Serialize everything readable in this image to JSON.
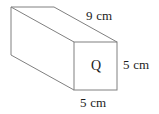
{
  "figure": {
    "name": "rectangular-prism-diagram",
    "shape": "rectangular prism",
    "line_color": "#808080",
    "text_color": "#1c1c1c",
    "background_color": "#ffffff",
    "labels": {
      "length": "9 cm",
      "height": "5 cm",
      "width": "5 cm",
      "face": "Q"
    },
    "dimensions": {
      "length_value": 9,
      "height_value": 5,
      "width_value": 5,
      "unit": "cm"
    },
    "geometry": {
      "front_face": {
        "top_left": [
          74,
          42
        ],
        "top_right": [
          117,
          42
        ],
        "bottom_right": [
          117,
          90
        ],
        "bottom_left": [
          74,
          90
        ]
      },
      "back_offset": [
        -63,
        -35
      ],
      "back_face": {
        "top_left": [
          11,
          7
        ],
        "top_right": [
          54,
          7
        ],
        "bottom_left": [
          11,
          55
        ]
      }
    }
  }
}
